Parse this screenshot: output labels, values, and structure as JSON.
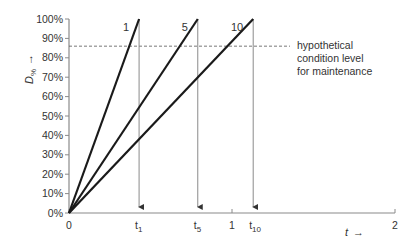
{
  "chart_data": {
    "type": "line",
    "title": "",
    "xlabel": "t →",
    "ylabel": "D% →",
    "xlim": [
      0,
      2
    ],
    "ylim": [
      0,
      100
    ],
    "grid": false,
    "y_ticks": [
      "0%",
      "10%",
      "20%",
      "30%",
      "40%",
      "50%",
      "60%",
      "70%",
      "80%",
      "90%",
      "100%"
    ],
    "x_ticks": [
      {
        "label": "0",
        "value": 0
      },
      {
        "label": "1",
        "value": 1
      },
      {
        "label": "2",
        "value": 2
      }
    ],
    "series": [
      {
        "name": "1",
        "x": [
          0,
          0.43
        ],
        "y": [
          0,
          100
        ],
        "end_label": "t1",
        "end_sub": "1"
      },
      {
        "name": "5",
        "x": [
          0,
          0.79
        ],
        "y": [
          0,
          100
        ],
        "end_label": "t5",
        "end_sub": "5"
      },
      {
        "name": "10",
        "x": [
          0,
          1.13
        ],
        "y": [
          0,
          100
        ],
        "end_label": "t10",
        "end_sub": "10"
      }
    ],
    "threshold": {
      "value": 86,
      "style": "dashed",
      "label_lines": [
        "hypothetical",
        "condition level",
        "for maintenance"
      ]
    },
    "annotations": [
      "Vertical arrows drop from each line's 100% point to the t-axis marking t1, t5, t10"
    ]
  },
  "labels": {
    "ylabel_main": "D",
    "ylabel_sub": "%",
    "ylabel_arrow": "→",
    "xlabel_main": "t",
    "xlabel_arrow": "→",
    "t_main": "t",
    "threshold_line1": "hypothetical",
    "threshold_line2": "condition level",
    "threshold_line3": "for maintenance"
  },
  "colors": {
    "line": "#1a1a1a",
    "axis": "#8a8a8a",
    "drop": "#8a8a8a",
    "text": "#333333"
  }
}
